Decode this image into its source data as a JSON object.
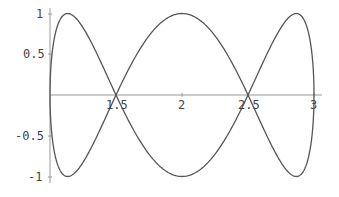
{
  "chart_data": {
    "type": "line",
    "title": "",
    "xlabel": "",
    "ylabel": "",
    "xlim": [
      1,
      3
    ],
    "ylim": [
      -1,
      1
    ],
    "grid": false,
    "x_ticks": [
      "1.5",
      "2",
      "2.5",
      "3"
    ],
    "y_ticks": [
      "1",
      "0.5",
      "-0.5",
      "-1"
    ],
    "series": [
      {
        "name": "curve-upper-start",
        "parametric": "x = 2 - cos(t), y = sin(3t), t in [0, pi]",
        "x": [
          1,
          1.134,
          1.5,
          2,
          2.5,
          2.866,
          3
        ],
        "values": [
          0,
          1,
          0,
          -1,
          0,
          1,
          0
        ]
      },
      {
        "name": "curve-lower-start",
        "parametric": "x = 2 - cos(t), y = -sin(3t), t in [0, pi]",
        "x": [
          1,
          1.134,
          1.5,
          2,
          2.5,
          2.866,
          3
        ],
        "values": [
          0,
          -1,
          0,
          1,
          0,
          -1,
          0
        ]
      }
    ],
    "line_color": "#555555",
    "axis_color": "#888888"
  }
}
